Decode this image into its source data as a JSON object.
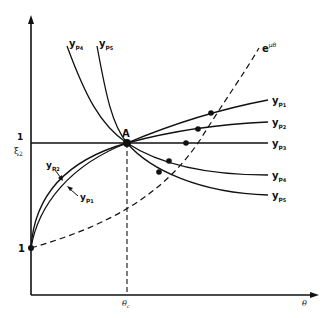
{
  "diagram": {
    "axes": {
      "x_label": "θ",
      "x_tick_label": "θ",
      "x_tick_sub": "c",
      "y_tick_one": "1",
      "y_tick_frac_num": "1",
      "y_tick_frac_den": "ξ",
      "y_tick_frac_den_sub": "2"
    },
    "point_A": "A",
    "exp_curve": {
      "base": "e",
      "exponent": "μθ"
    },
    "curves": [
      {
        "name": "y",
        "sub": "p",
        "subsub": "1"
      },
      {
        "name": "y",
        "sub": "p",
        "subsub": "2"
      },
      {
        "name": "y",
        "sub": "p",
        "subsub": "3"
      },
      {
        "name": "y",
        "sub": "p",
        "subsub": "4"
      },
      {
        "name": "y",
        "sub": "p",
        "subsub": "5"
      }
    ],
    "colors": {
      "ink": "#111111",
      "background": "#ffffff"
    }
  }
}
